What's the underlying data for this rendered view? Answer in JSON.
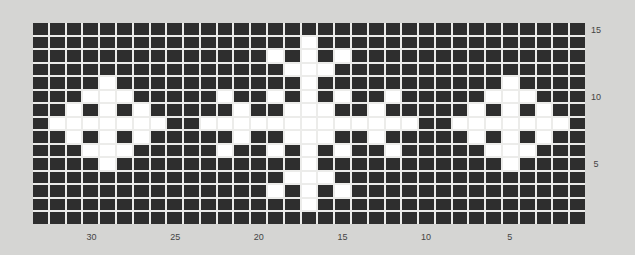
{
  "chart_data": {
    "type": "heatmap",
    "title": "",
    "columns": 33,
    "rows": 15,
    "column_numbering": "right-to-left, 1 at right",
    "row_numbering": "bottom-to-top, 1 at bottom",
    "x_tick_labels": [
      "30",
      "25",
      "20",
      "15",
      "10",
      "5"
    ],
    "x_tick_columns": [
      30,
      25,
      20,
      15,
      10,
      5
    ],
    "y_tick_labels": [
      "15",
      "10",
      "5"
    ],
    "y_tick_rows": [
      15,
      10,
      5
    ],
    "colors": {
      "background": "#2e2e2e",
      "motif": "#ffffff",
      "gridline": "#ececea",
      "page": "#d5d5d3"
    },
    "white_cells_by_row": {
      "15": [],
      "14": [
        17
      ],
      "13": [
        19,
        17,
        15
      ],
      "12": [
        18,
        17,
        16
      ],
      "11": [
        29,
        17,
        5
      ],
      "10": [
        30,
        29,
        28,
        22,
        19,
        17,
        15,
        12,
        6,
        5,
        4
      ],
      "9": [
        31,
        29,
        27,
        21,
        18,
        17,
        16,
        13,
        7,
        5,
        3
      ],
      "8": [
        32,
        31,
        30,
        29,
        28,
        27,
        26,
        23,
        22,
        21,
        20,
        19,
        18,
        17,
        16,
        15,
        14,
        13,
        12,
        11,
        8,
        7,
        6,
        5,
        4,
        3,
        2
      ],
      "7": [
        31,
        29,
        27,
        21,
        18,
        17,
        16,
        13,
        7,
        5,
        3
      ],
      "6": [
        30,
        29,
        28,
        22,
        19,
        17,
        15,
        12,
        6,
        5,
        4
      ],
      "5": [
        29,
        17,
        5
      ],
      "4": [
        18,
        17,
        16
      ],
      "3": [
        19,
        17,
        15
      ],
      "2": [
        17
      ],
      "1": []
    }
  }
}
